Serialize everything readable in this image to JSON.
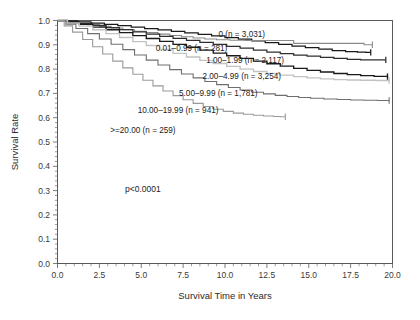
{
  "chart_data": {
    "type": "line",
    "title": "",
    "subtitle": "",
    "xlabel": "Survival Time in Years",
    "ylabel": "Survival Rate",
    "xlim": [
      0.0,
      20.0
    ],
    "ylim": [
      0.0,
      1.0
    ],
    "xticks": [
      0.0,
      2.5,
      5.0,
      7.5,
      10.0,
      12.5,
      15.0,
      17.5,
      20.0
    ],
    "xtick_labels": [
      "0.0",
      "2.5",
      "5.0",
      "7.5",
      "10.0",
      "12.5",
      "15.0",
      "17.5",
      "20.0"
    ],
    "yticks": [
      0.0,
      0.1,
      0.2,
      0.3,
      0.4,
      0.5,
      0.6,
      0.7,
      0.8,
      0.9,
      1.0
    ],
    "ytick_labels": [
      "0.0",
      "0.1",
      "0.2",
      "0.3",
      "0.4",
      "0.5",
      "0.6",
      "0.7",
      "0.8",
      "0.9",
      "1.0"
    ],
    "grid": false,
    "legend_position": "inline-right-of-curves",
    "annotation": "p<0.0001",
    "annotation_x": 5.1,
    "annotation_y": 0.295,
    "series": [
      {
        "name": "0 (n = 3,031)",
        "color": "#1a1a1a",
        "width": 1.25,
        "label_x": 11.0,
        "label_y": 0.945,
        "points": [
          [
            0,
            1.0
          ],
          [
            0.6,
            0.998
          ],
          [
            1.2,
            0.994
          ],
          [
            2.0,
            0.989
          ],
          [
            2.8,
            0.984
          ],
          [
            3.6,
            0.979
          ],
          [
            4.4,
            0.973
          ],
          [
            5.2,
            0.967
          ],
          [
            6.0,
            0.961
          ],
          [
            6.8,
            0.955
          ],
          [
            7.6,
            0.949
          ],
          [
            8.4,
            0.943
          ],
          [
            9.2,
            0.937
          ],
          [
            10.0,
            0.93
          ],
          [
            10.8,
            0.923
          ],
          [
            11.6,
            0.916
          ],
          [
            12.4,
            0.909
          ],
          [
            13.2,
            0.902
          ],
          [
            14.0,
            0.895
          ],
          [
            14.8,
            0.888
          ],
          [
            15.6,
            0.882
          ],
          [
            16.4,
            0.876
          ],
          [
            17.2,
            0.872
          ],
          [
            17.9,
            0.87
          ],
          [
            18.4,
            0.869
          ],
          [
            18.7,
            0.869
          ]
        ]
      },
      {
        "name": "0.01–0.99 (n = 281)",
        "color": "#8a8a8a",
        "width": 1.1,
        "label_x": 8.0,
        "label_y": 0.886,
        "points": [
          [
            0,
            1.0
          ],
          [
            0.5,
            0.996
          ],
          [
            1.1,
            0.99
          ],
          [
            1.8,
            0.983
          ],
          [
            2.5,
            0.976
          ],
          [
            3.2,
            0.969
          ],
          [
            3.9,
            0.962
          ],
          [
            4.6,
            0.956
          ],
          [
            5.3,
            0.95
          ],
          [
            6.0,
            0.944
          ],
          [
            6.7,
            0.938
          ],
          [
            7.4,
            0.933
          ],
          [
            8.1,
            0.928
          ],
          [
            8.8,
            0.924
          ],
          [
            9.5,
            0.921
          ],
          [
            10.3,
            0.919
          ],
          [
            11.2,
            0.918
          ],
          [
            12.1,
            0.918
          ],
          [
            13.0,
            0.918
          ],
          [
            13.9,
            0.918
          ],
          [
            14.1,
            0.906
          ],
          [
            15.0,
            0.906
          ],
          [
            15.9,
            0.906
          ],
          [
            16.8,
            0.906
          ],
          [
            17.6,
            0.906
          ],
          [
            18.3,
            0.9
          ],
          [
            18.8,
            0.9
          ]
        ]
      },
      {
        "name": "1.00–1.99 (n = 2,117)",
        "color": "#2e2e2e",
        "width": 1.25,
        "label_x": 11.2,
        "label_y": 0.838,
        "points": [
          [
            0,
            1.0
          ],
          [
            0.6,
            0.995
          ],
          [
            1.3,
            0.988
          ],
          [
            2.1,
            0.98
          ],
          [
            2.9,
            0.971
          ],
          [
            3.7,
            0.962
          ],
          [
            4.5,
            0.953
          ],
          [
            5.3,
            0.944
          ],
          [
            6.1,
            0.935
          ],
          [
            6.9,
            0.926
          ],
          [
            7.7,
            0.918
          ],
          [
            8.5,
            0.91
          ],
          [
            9.3,
            0.902
          ],
          [
            10.1,
            0.894
          ],
          [
            10.9,
            0.886
          ],
          [
            11.7,
            0.878
          ],
          [
            12.5,
            0.87
          ],
          [
            13.3,
            0.864
          ],
          [
            14.1,
            0.858
          ],
          [
            14.9,
            0.853
          ],
          [
            15.7,
            0.848
          ],
          [
            16.5,
            0.844
          ],
          [
            17.3,
            0.84
          ],
          [
            18.1,
            0.838
          ],
          [
            18.9,
            0.838
          ],
          [
            19.6,
            0.838
          ]
        ]
      },
      {
        "name": "2.00–4.99 (n = 3,254)",
        "color": "#1a1a1a",
        "width": 1.35,
        "label_x": 11.0,
        "label_y": 0.772,
        "points": [
          [
            0,
            1.0
          ],
          [
            0.6,
            0.993
          ],
          [
            1.3,
            0.984
          ],
          [
            2.1,
            0.973
          ],
          [
            2.9,
            0.962
          ],
          [
            3.7,
            0.95
          ],
          [
            4.5,
            0.938
          ],
          [
            5.3,
            0.926
          ],
          [
            6.1,
            0.914
          ],
          [
            6.9,
            0.902
          ],
          [
            7.7,
            0.89
          ],
          [
            8.5,
            0.878
          ],
          [
            9.3,
            0.866
          ],
          [
            10.1,
            0.855
          ],
          [
            10.9,
            0.844
          ],
          [
            11.7,
            0.833
          ],
          [
            12.5,
            0.822
          ],
          [
            13.3,
            0.812
          ],
          [
            14.1,
            0.803
          ],
          [
            14.9,
            0.795
          ],
          [
            15.7,
            0.788
          ],
          [
            16.5,
            0.782
          ],
          [
            17.3,
            0.777
          ],
          [
            18.1,
            0.773
          ],
          [
            18.9,
            0.77
          ],
          [
            19.7,
            0.769
          ]
        ]
      },
      {
        "name": "5.00–9.99 (n = 1,781)",
        "color": "#c2c2c2",
        "width": 1.35,
        "label_x": 9.6,
        "label_y": 0.702,
        "points": [
          [
            0,
            1.0
          ],
          [
            0.6,
            0.99
          ],
          [
            1.3,
            0.977
          ],
          [
            2.1,
            0.962
          ],
          [
            2.9,
            0.946
          ],
          [
            3.7,
            0.93
          ],
          [
            4.5,
            0.913
          ],
          [
            5.3,
            0.897
          ],
          [
            6.1,
            0.881
          ],
          [
            6.9,
            0.865
          ],
          [
            7.7,
            0.85
          ],
          [
            8.5,
            0.836
          ],
          [
            9.3,
            0.823
          ],
          [
            10.1,
            0.811
          ],
          [
            10.9,
            0.8
          ],
          [
            11.7,
            0.79
          ],
          [
            12.5,
            0.782
          ],
          [
            13.3,
            0.775
          ],
          [
            14.1,
            0.769
          ],
          [
            14.9,
            0.764
          ],
          [
            15.7,
            0.76
          ],
          [
            16.5,
            0.757
          ],
          [
            17.3,
            0.755
          ],
          [
            18.1,
            0.754
          ],
          [
            19.0,
            0.753
          ],
          [
            19.8,
            0.753
          ]
        ]
      },
      {
        "name": "10.00–19.99 (n = 941)",
        "color": "#6e6e6e",
        "width": 1.1,
        "label_x": 7.2,
        "label_y": 0.632,
        "points": [
          [
            0,
            1.0
          ],
          [
            0.5,
            0.985
          ],
          [
            1.1,
            0.967
          ],
          [
            1.8,
            0.946
          ],
          [
            2.5,
            0.924
          ],
          [
            3.2,
            0.902
          ],
          [
            3.9,
            0.88
          ],
          [
            4.6,
            0.858
          ],
          [
            5.3,
            0.837
          ],
          [
            6.0,
            0.817
          ],
          [
            6.7,
            0.798
          ],
          [
            7.4,
            0.78
          ],
          [
            8.1,
            0.764
          ],
          [
            8.8,
            0.749
          ],
          [
            9.5,
            0.736
          ],
          [
            10.2,
            0.724
          ],
          [
            10.9,
            0.714
          ],
          [
            11.6,
            0.705
          ],
          [
            12.3,
            0.698
          ],
          [
            13.0,
            0.692
          ],
          [
            13.7,
            0.687
          ],
          [
            14.4,
            0.683
          ],
          [
            15.1,
            0.68
          ],
          [
            15.9,
            0.677
          ],
          [
            16.7,
            0.675
          ],
          [
            17.5,
            0.673
          ],
          [
            18.3,
            0.672
          ],
          [
            19.1,
            0.671
          ],
          [
            19.8,
            0.671
          ]
        ]
      },
      {
        "name": ">=20.00 (n = 259)",
        "color": "#9a9a9a",
        "width": 1.1,
        "label_x": 5.1,
        "label_y": 0.548,
        "points": [
          [
            0,
            1.0
          ],
          [
            0.4,
            0.978
          ],
          [
            0.9,
            0.952
          ],
          [
            1.5,
            0.922
          ],
          [
            2.1,
            0.892
          ],
          [
            2.7,
            0.862
          ],
          [
            3.3,
            0.833
          ],
          [
            3.9,
            0.805
          ],
          [
            4.5,
            0.779
          ],
          [
            5.1,
            0.754
          ],
          [
            5.7,
            0.731
          ],
          [
            6.3,
            0.71
          ],
          [
            6.9,
            0.691
          ],
          [
            7.5,
            0.674
          ],
          [
            8.1,
            0.659
          ],
          [
            8.7,
            0.646
          ],
          [
            9.3,
            0.635
          ],
          [
            9.9,
            0.626
          ],
          [
            10.5,
            0.619
          ],
          [
            11.1,
            0.614
          ],
          [
            11.7,
            0.61
          ],
          [
            12.3,
            0.607
          ],
          [
            12.9,
            0.605
          ],
          [
            13.3,
            0.604
          ],
          [
            13.6,
            0.604
          ]
        ]
      }
    ]
  }
}
